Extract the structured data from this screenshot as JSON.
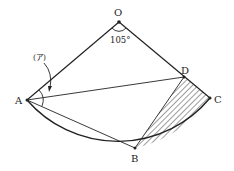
{
  "diagram": {
    "points": {
      "O": {
        "label": "O",
        "x": 119,
        "y": 22
      },
      "A": {
        "label": "A",
        "x": 27,
        "y": 100
      },
      "B": {
        "label": "B",
        "x": 135,
        "y": 148
      },
      "C": {
        "label": "C",
        "x": 210,
        "y": 98
      },
      "D": {
        "label": "D",
        "x": 184,
        "y": 77
      }
    },
    "angle_O_label": "105°",
    "angle_A_label": "(ア)",
    "stroke_color": "#222222"
  }
}
